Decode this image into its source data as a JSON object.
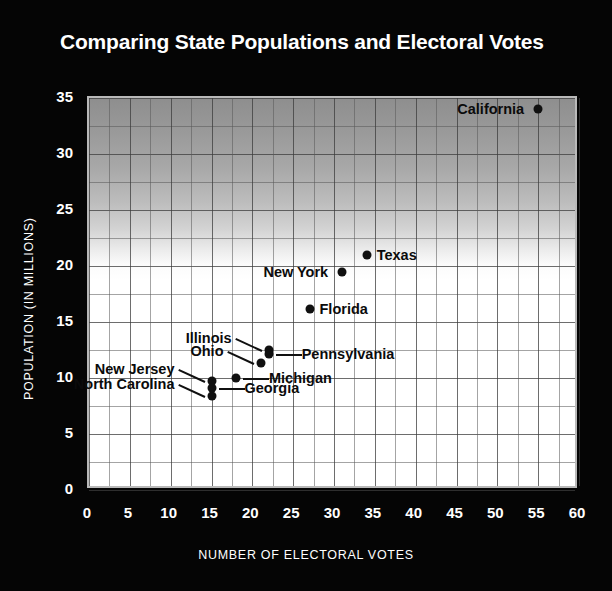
{
  "chart_data": {
    "type": "scatter",
    "title": "Comparing State Populations and Electoral Votes",
    "xlabel": "NUMBER OF ELECTORAL VOTES",
    "ylabel": "POPULATION (IN MILLIONS)",
    "xlim": [
      0,
      60
    ],
    "ylim": [
      0,
      35
    ],
    "xticks": [
      0,
      5,
      10,
      15,
      20,
      25,
      30,
      35,
      40,
      45,
      50,
      55,
      60
    ],
    "yticks": [
      0,
      5,
      10,
      15,
      20,
      25,
      30,
      35
    ],
    "grid": true,
    "legend": "none",
    "points": [
      {
        "label": "California",
        "x": 55,
        "y": 34.0,
        "label_side": "left",
        "leader": false
      },
      {
        "label": "Texas",
        "x": 34,
        "y": 21.0,
        "label_side": "right",
        "leader": false
      },
      {
        "label": "New York",
        "x": 31,
        "y": 19.5,
        "label_side": "left",
        "leader": false
      },
      {
        "label": "Florida",
        "x": 27,
        "y": 16.2,
        "label_side": "right",
        "leader": false
      },
      {
        "label": "Illinois",
        "x": 22,
        "y": 12.5,
        "label_side": "left",
        "leader": true
      },
      {
        "label": "Pennsylvania",
        "x": 22,
        "y": 12.1,
        "label_side": "right",
        "leader": true
      },
      {
        "label": "Ohio",
        "x": 21,
        "y": 11.3,
        "label_side": "left",
        "leader": true
      },
      {
        "label": "Michigan",
        "x": 18,
        "y": 10.0,
        "label_side": "right",
        "leader": true
      },
      {
        "label": "New Jersey",
        "x": 15,
        "y": 9.7,
        "label_side": "left",
        "leader": true
      },
      {
        "label": "Georgia",
        "x": 15,
        "y": 9.1,
        "label_side": "right",
        "leader": true
      },
      {
        "label": "North Carolina",
        "x": 15,
        "y": 8.4,
        "label_side": "left",
        "leader": true
      }
    ],
    "colors": {
      "page_background": "#050505",
      "text": "#ffffff",
      "point": "#101010",
      "plot_top": "#8e8e8e",
      "plot_bottom": "#ffffff",
      "gridline": "#5a5a5a"
    }
  }
}
